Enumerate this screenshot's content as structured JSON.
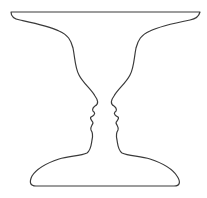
{
  "illustration": {
    "subject": "Rubin vase illusion",
    "stroke_color": "#3a3a3a",
    "background_color": "#ffffff",
    "stroke_width": 1.2
  }
}
